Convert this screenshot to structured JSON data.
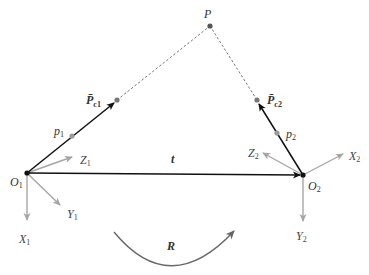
{
  "diagram": {
    "type": "stereo-camera-geometry",
    "colors": {
      "black": "#111111",
      "gray_axis": "#a6a6a6",
      "gray_point": "#8c8c8c",
      "dark_point": "#555555",
      "dashed": "#777777",
      "arc": "#666666"
    },
    "points": {
      "P": {
        "label": "P",
        "x": 210,
        "y": 26
      },
      "Pc1": {
        "label": "P̄",
        "sub": "c1",
        "x": 117,
        "y": 100
      },
      "Pc2": {
        "label": "P̄",
        "sub": "c2",
        "x": 257,
        "y": 100
      },
      "p1": {
        "label": "p",
        "sub": "1",
        "x": 72,
        "y": 136
      },
      "p2": {
        "label": "p",
        "sub": "2",
        "x": 277,
        "y": 133
      },
      "O1": {
        "label": "O",
        "sub": "1",
        "x": 27,
        "y": 173
      },
      "O2": {
        "label": "O",
        "sub": "2",
        "x": 303,
        "y": 175
      }
    },
    "frame1_axes": {
      "X": {
        "label": "X",
        "sub": "1"
      },
      "Y": {
        "label": "Y",
        "sub": "1"
      },
      "Z": {
        "label": "Z",
        "sub": "1"
      }
    },
    "frame2_axes": {
      "X": {
        "label": "X",
        "sub": "2"
      },
      "Y": {
        "label": "Y",
        "sub": "2"
      },
      "Z": {
        "label": "Z",
        "sub": "2"
      }
    },
    "translation_label": "t",
    "rotation_label": "R"
  }
}
